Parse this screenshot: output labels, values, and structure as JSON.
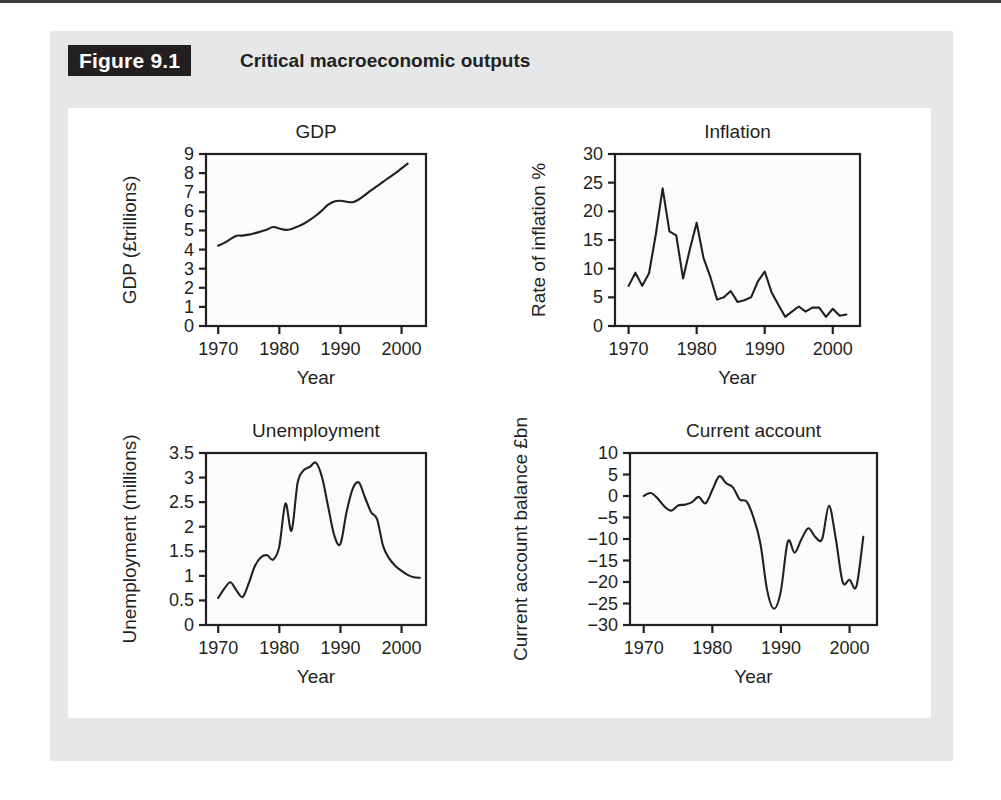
{
  "figure": {
    "tag": "Figure 9.1",
    "caption": "Critical macroeconomic outputs",
    "tag_bg_color": "#231f20",
    "frame_bg_color": "#e6e7e8",
    "panel_bg_color": "#ffffff",
    "line_color": "#231f20"
  },
  "chart_data": [
    {
      "id": "gdp",
      "type": "line",
      "title": "GDP",
      "xlabel": "Year",
      "ylabel": "GDP (£trillions)",
      "xlim": [
        1968,
        2004
      ],
      "ylim": [
        0,
        9
      ],
      "xticks": [
        1970,
        1980,
        1990,
        2000
      ],
      "xtick_labels": [
        "1970",
        "1980",
        "1990",
        "2000"
      ],
      "yticks": [
        0,
        1,
        2,
        3,
        4,
        5,
        6,
        7,
        8,
        9
      ],
      "ytick_labels": [
        "0",
        "1",
        "2",
        "3",
        "4",
        "5",
        "6",
        "7",
        "8",
        "9"
      ],
      "grid": false,
      "legend": "none",
      "x": [
        1970,
        1971,
        1972,
        1973,
        1974,
        1975,
        1976,
        1977,
        1978,
        1979,
        1980,
        1981,
        1982,
        1983,
        1984,
        1985,
        1986,
        1987,
        1988,
        1989,
        1990,
        1991,
        1992,
        1993,
        1994,
        1995,
        1996,
        1997,
        1998,
        1999,
        2000,
        2001
      ],
      "y": [
        4.2,
        4.35,
        4.55,
        4.72,
        4.73,
        4.78,
        4.86,
        4.95,
        5.05,
        5.18,
        5.1,
        5.03,
        5.08,
        5.2,
        5.35,
        5.55,
        5.78,
        6.05,
        6.35,
        6.52,
        6.55,
        6.5,
        6.48,
        6.62,
        6.85,
        7.1,
        7.32,
        7.55,
        7.78,
        8.0,
        8.25,
        8.5
      ],
      "ylabel_unit": "£trillions"
    },
    {
      "id": "inflation",
      "type": "line",
      "title": "Inflation",
      "xlabel": "Year",
      "ylabel": "Rate of inflation %",
      "xlim": [
        1968,
        2004
      ],
      "ylim": [
        0,
        30
      ],
      "xticks": [
        1970,
        1980,
        1990,
        2000
      ],
      "xtick_labels": [
        "1970",
        "1980",
        "1990",
        "2000"
      ],
      "yticks": [
        0,
        5,
        10,
        15,
        20,
        25,
        30
      ],
      "ytick_labels": [
        "0",
        "5",
        "10",
        "15",
        "20",
        "25",
        "30"
      ],
      "grid": false,
      "legend": "none",
      "x": [
        1970,
        1971,
        1972,
        1973,
        1974,
        1975,
        1976,
        1977,
        1978,
        1979,
        1980,
        1981,
        1982,
        1983,
        1984,
        1985,
        1986,
        1987,
        1988,
        1989,
        1990,
        1991,
        1992,
        1993,
        1994,
        1995,
        1996,
        1997,
        1998,
        1999,
        2000,
        2001,
        2002
      ],
      "y": [
        7.0,
        9.3,
        7.0,
        9.2,
        16.0,
        24.0,
        16.5,
        15.8,
        8.3,
        13.4,
        18.0,
        11.9,
        8.6,
        4.6,
        5.0,
        6.1,
        4.2,
        4.5,
        5.0,
        7.8,
        9.5,
        5.9,
        3.7,
        1.6,
        2.5,
        3.4,
        2.5,
        3.2,
        3.2,
        1.6,
        3.0,
        1.8,
        2.0
      ]
    },
    {
      "id": "unemployment",
      "type": "line",
      "title": "Unemployment",
      "xlabel": "Year",
      "ylabel": "Unemployment (millions)",
      "xlim": [
        1968,
        2004
      ],
      "ylim": [
        0,
        3.5
      ],
      "xticks": [
        1970,
        1980,
        1990,
        2000
      ],
      "xtick_labels": [
        "1970",
        "1980",
        "1990",
        "2000"
      ],
      "yticks": [
        0,
        0.5,
        1,
        1.5,
        2,
        2.5,
        3,
        3.5
      ],
      "ytick_labels": [
        "0",
        "0.5",
        "1",
        "1.5",
        "2",
        "2.5",
        "3",
        "3.5"
      ],
      "grid": false,
      "legend": "none",
      "x": [
        1970,
        1971,
        1972,
        1973,
        1974,
        1975,
        1976,
        1977,
        1978,
        1979,
        1980,
        1981,
        1982,
        1983,
        1984,
        1985,
        1986,
        1987,
        1988,
        1989,
        1990,
        1991,
        1992,
        1993,
        1994,
        1995,
        1996,
        1997,
        1998,
        1999,
        2000,
        2001,
        2002,
        2003
      ],
      "y": [
        0.55,
        0.74,
        0.87,
        0.7,
        0.57,
        0.85,
        1.2,
        1.38,
        1.42,
        1.33,
        1.6,
        2.47,
        1.92,
        2.9,
        3.15,
        3.22,
        3.3,
        3.0,
        2.4,
        1.82,
        1.65,
        2.3,
        2.77,
        2.9,
        2.6,
        2.3,
        2.15,
        1.6,
        1.35,
        1.2,
        1.1,
        1.02,
        0.97,
        0.96
      ]
    },
    {
      "id": "current-account",
      "type": "line",
      "title": "Current account",
      "xlabel": "Year",
      "ylabel": "Current account balance £bn",
      "xlim": [
        1968,
        2004
      ],
      "ylim": [
        -30,
        10
      ],
      "xticks": [
        1970,
        1980,
        1990,
        2000
      ],
      "xtick_labels": [
        "1970",
        "1980",
        "1990",
        "2000"
      ],
      "yticks": [
        -30,
        -25,
        -20,
        -15,
        -10,
        -5,
        0,
        5,
        10
      ],
      "ytick_labels": [
        "−30",
        "−25",
        "−20",
        "−15",
        "−10",
        "−5",
        "0",
        "5",
        "10"
      ],
      "grid": false,
      "legend": "none",
      "x": [
        1970,
        1971,
        1972,
        1973,
        1974,
        1975,
        1976,
        1977,
        1978,
        1979,
        1980,
        1981,
        1982,
        1983,
        1984,
        1985,
        1986,
        1987,
        1988,
        1989,
        1990,
        1991,
        1992,
        1993,
        1994,
        1995,
        1996,
        1997,
        1998,
        1999,
        2000,
        2001,
        2002
      ],
      "y": [
        0.0,
        0.7,
        -0.5,
        -2.4,
        -3.4,
        -2.2,
        -2.0,
        -1.5,
        -0.2,
        -1.7,
        1.4,
        4.6,
        3.0,
        2.0,
        -0.8,
        -1.3,
        -5.0,
        -11.0,
        -22.0,
        -26.2,
        -22.0,
        -10.6,
        -13.2,
        -10.0,
        -7.5,
        -9.5,
        -10.0,
        -2.3,
        -10.0,
        -20.0,
        -19.5,
        -21.0,
        -9.5
      ]
    }
  ]
}
